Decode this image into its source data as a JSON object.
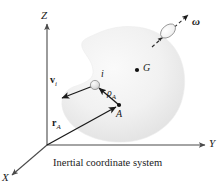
{
  "figure": {
    "caption": "Inertial coordinate system",
    "axes": {
      "z_label": "Z",
      "y_label": "Y",
      "x_label": "X"
    },
    "points": {
      "center_of_mass_label": "G",
      "reference_point_label": "A",
      "particle_label": "i"
    },
    "vectors": {
      "velocity_label": "v",
      "velocity_sub": "i",
      "position_a_label": "r",
      "position_a_sub": "A",
      "rho_label": "ρ",
      "rho_sub": "A",
      "angular_velocity_label": "ω"
    },
    "colors": {
      "ink": "#1a1a1a",
      "axis": "#4a4a4a",
      "body_fill": "#f0f0f0",
      "body_fill_dark": "#e2e2e2",
      "particle_fill": "#d8d8d8",
      "background": "#ffffff"
    },
    "geometry": {
      "origin": [
        47,
        145
      ],
      "particle": [
        95,
        85
      ],
      "point_a": [
        119,
        105
      ],
      "point_g": [
        137,
        70
      ],
      "z_tip": [
        47,
        22
      ],
      "y_tip": [
        207,
        145
      ],
      "x_tip": [
        10,
        177
      ]
    }
  }
}
